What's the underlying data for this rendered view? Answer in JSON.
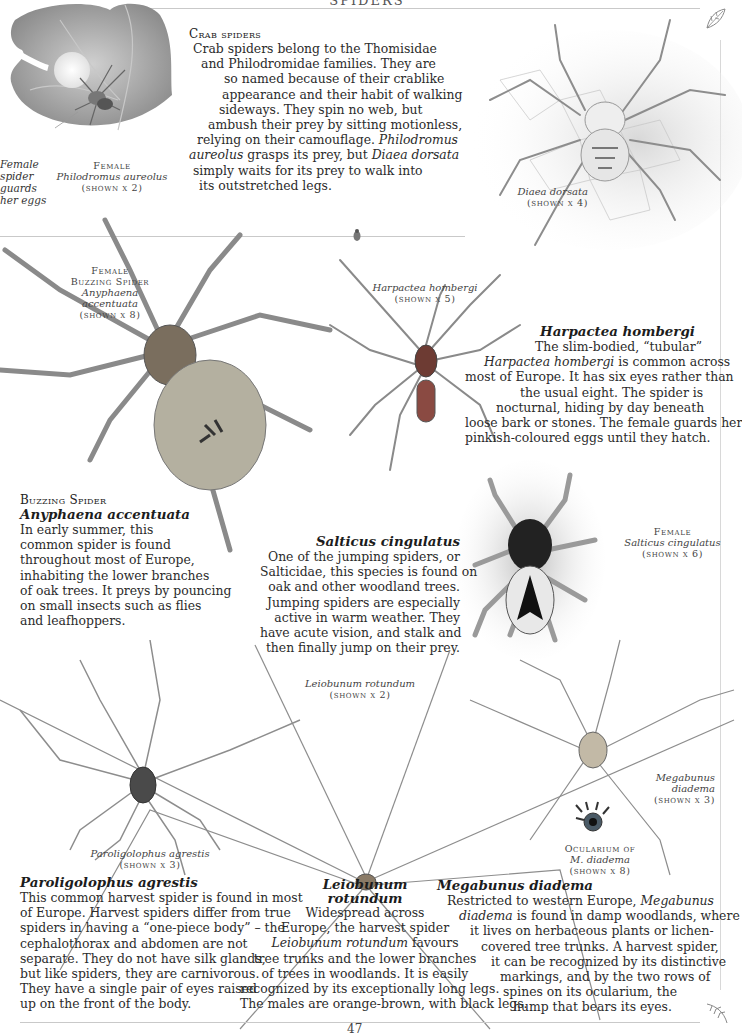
{
  "page": {
    "running_head": "SPIDERS",
    "page_number": "47"
  },
  "crab_spiders": {
    "heading": "Crab spiders",
    "lines": [
      "Crab spiders belong to the Thomisidae",
      "and Philodromidae families. They are",
      "so named because of their crablike",
      "appearance and their habit of walking",
      "sideways. They spin no web, but",
      "ambush their prey by sitting motionless,",
      "relying on their camouflage."
    ],
    "line8_it1": "Philodromus",
    "line9_it": "aureolus",
    "line9_rest": " grasps its prey, but ",
    "line9_it2": "Diaea dorsata",
    "line10": "simply waits for its prey to walk into",
    "line11": "its outstretched legs."
  },
  "captions": {
    "egg_guard": [
      "Female",
      "spider",
      "guards",
      "her eggs"
    ],
    "philodromus": {
      "sex": "Female",
      "name": "Philodromus aureolus",
      "scale": "(shown x 2)"
    },
    "diaea": {
      "name": "Diaea dorsata",
      "scale": "(shown x 4)"
    },
    "anyphaena": {
      "sex": "Female",
      "common": "Buzzing Spider",
      "name": "Anyphaena accentuata",
      "scale": "(shown x 8)"
    },
    "harpactea": {
      "name": "Harpactea hombergi",
      "scale": "(shown x 5)"
    },
    "salticus": {
      "sex": "Female",
      "name": "Salticus cingulatus",
      "scale": "(shown x 6)"
    },
    "leiobunum": {
      "name": "Leiobunum rotundum",
      "scale": "(shown x 2)"
    },
    "megabunus": {
      "name1": "Megabunus",
      "name2": "diadema",
      "scale": "(shown x 3)"
    },
    "ocularium": {
      "label": "Ocularium of",
      "name": "M. diadema",
      "scale": "(shown x 8)"
    },
    "paroligolophus": {
      "name": "Paroligolophus agrestis",
      "scale": "(shown x 3)"
    }
  },
  "harpactea_text": {
    "title": "Harpactea hombergi",
    "line1": "The slim-bodied, “tubular”",
    "line2_it": "Harpactea hombergi",
    "line2_rest": " is common across",
    "lines": [
      "most of Europe. It has six eyes rather than",
      "the usual eight. The spider is",
      "nocturnal, hiding by day beneath",
      "loose bark or stones. The female guards her",
      "pinkish-coloured eggs until they hatch."
    ]
  },
  "anyphaena_text": {
    "common": "Buzzing Spider",
    "title": "Anyphaena accentuata",
    "lines": [
      "In early summer, this",
      "common spider is found",
      "throughout most of Europe,",
      "inhabiting the lower branches",
      "of oak trees. It preys by pouncing",
      "on small insects such as flies",
      "and leafhoppers."
    ]
  },
  "salticus_text": {
    "title": "Salticus cingulatus",
    "lines": [
      "One of the jumping spiders, or",
      "Salticidae, this species is found on",
      "oak and other woodland trees.",
      "Jumping spiders are especially",
      "active in warm weather. They",
      "have acute vision, and stalk and",
      "then finally jump on their prey."
    ]
  },
  "paroligolophus_text": {
    "title": "Paroligolophus agrestis",
    "lines": [
      "This common harvest spider is found in most",
      "of Europe. Harvest spiders differ from true",
      "spiders in having a “one-piece body” – the",
      "cephalothorax and abdomen are not",
      "separate. They do not have silk glands,",
      "but like spiders, they are carnivorous.",
      "They have a single pair of eyes raised",
      "up on the front of the body."
    ]
  },
  "leiobunum_text": {
    "title1": "Leiobunum",
    "title2": "rotundum",
    "line1": "Widespread across",
    "line2": "Europe, the harvest spider",
    "line3_it": "Leiobunum rotundum",
    "line3_rest": " favours",
    "lines": [
      "tree trunks and the lower branches",
      "of trees in woodlands. It is easily",
      "recognized by its exceptionally long legs.",
      "The males are orange-brown, with black legs."
    ]
  },
  "megabunus_text": {
    "title": "Megabunus diadema",
    "line1": "Restricted to western Europe, ",
    "line1_it": "Megabunus",
    "line2_it": "diadema",
    "line2_rest": " is found in damp woodlands, where",
    "lines": [
      "it lives on herbaceous plants or lichen-",
      "covered tree trunks. A harvest spider,",
      "it can be recognized by its distinctive",
      "markings, and by the two rows of",
      "spines on its ocularium, the",
      "hump that bears its eyes."
    ]
  },
  "colors": {
    "text": "#2b2b2b",
    "rule": "#c9c9c9",
    "illustration_gray": "#9a9a9a",
    "leaf_gray": "#b8b8b8"
  }
}
